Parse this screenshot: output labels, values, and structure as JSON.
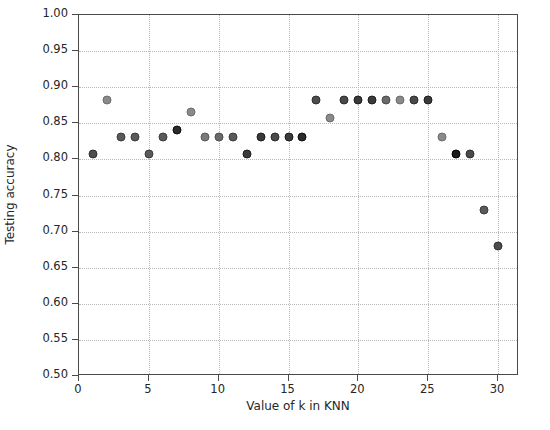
{
  "chart_data": {
    "type": "scatter",
    "title": "",
    "xlabel": "Value of k in KNN",
    "ylabel": "Testing accuracy",
    "xlim": [
      0,
      31.5
    ],
    "ylim": [
      0.5,
      1.0
    ],
    "xticks": [
      0,
      5,
      10,
      15,
      20,
      25,
      30
    ],
    "xtick_labels": [
      "0",
      "5",
      "10",
      "15",
      "20",
      "25",
      "30"
    ],
    "yticks": [
      0.5,
      0.55,
      0.6,
      0.65,
      0.7,
      0.75,
      0.8,
      0.85,
      0.9,
      0.95,
      1.0
    ],
    "ytick_labels": [
      "0.50",
      "0.55",
      "0.60",
      "0.65",
      "0.70",
      "0.75",
      "0.80",
      "0.85",
      "0.90",
      "0.95",
      "1.00"
    ],
    "grid": true,
    "grid_style": "dotted",
    "grid_color": "#b9b9b9",
    "legend": null,
    "marker": "circle",
    "marker_size": 9,
    "x": [
      1,
      2,
      3,
      4,
      5,
      6,
      7,
      8,
      9,
      10,
      11,
      12,
      13,
      14,
      15,
      16,
      17,
      18,
      19,
      20,
      21,
      22,
      23,
      24,
      25,
      26,
      27,
      28,
      29,
      30
    ],
    "y": [
      0.807,
      0.882,
      0.831,
      0.831,
      0.807,
      0.831,
      0.841,
      0.866,
      0.831,
      0.831,
      0.831,
      0.807,
      0.831,
      0.831,
      0.831,
      0.831,
      0.882,
      0.858,
      0.882,
      0.882,
      0.882,
      0.882,
      0.882,
      0.882,
      0.882,
      0.831,
      0.807,
      0.807,
      0.73,
      0.68
    ],
    "point_colors": [
      "#4d4d4d",
      "#8a8a8a",
      "#5a5a5a",
      "#5a5a5a",
      "#5a5a5a",
      "#5a5a5a",
      "#2b2b2b",
      "#8a8a8a",
      "#7a7a7a",
      "#6a6a6a",
      "#5a5a5a",
      "#3a3a3a",
      "#3a3a3a",
      "#4a4a4a",
      "#3a3a3a",
      "#2b2b2b",
      "#4d4d4d",
      "#8a8a8a",
      "#4a4a4a",
      "#3a3a3a",
      "#3a3a3a",
      "#6a6a6a",
      "#8a8a8a",
      "#4a4a4a",
      "#3a3a3a",
      "#8a8a8a",
      "#1c1c1c",
      "#4a4a4a",
      "#5a5a5a",
      "#4d4d4d"
    ]
  },
  "axes": {
    "xlabel": "Value of k in KNN",
    "ylabel": "Testing accuracy"
  }
}
